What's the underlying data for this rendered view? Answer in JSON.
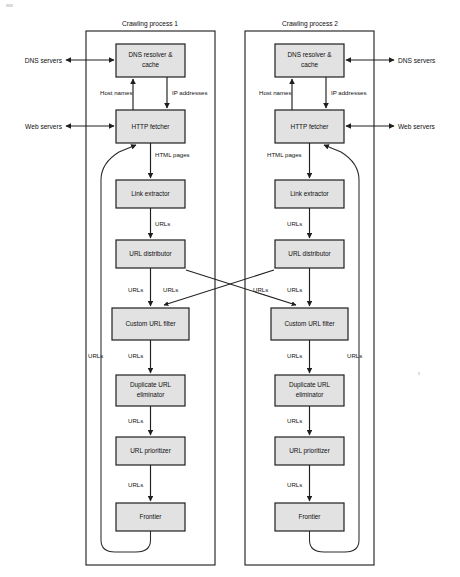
{
  "diagram": {
    "type": "flowchart",
    "canvas": {
      "width": 460,
      "height": 577
    },
    "style": {
      "box_fill": "#e2e2e2",
      "box_stroke": "#1f1f1f",
      "line_color": "#1f1f1f",
      "background": "#ffffff"
    },
    "processes": [
      {
        "id": "process-1",
        "title": "Crawling process 1",
        "mirrored": false,
        "nodes": [
          {
            "id": "dns-resolver",
            "label": "DNS resolver & cache"
          },
          {
            "id": "http-fetcher",
            "label": "HTTP fetcher"
          },
          {
            "id": "link-extractor",
            "label": "Link extractor"
          },
          {
            "id": "url-distributor",
            "label": "URL distributor"
          },
          {
            "id": "custom-url-filter",
            "label": "Custom URL filter"
          },
          {
            "id": "duplicate-url-eliminator",
            "label": "Duplicate URL eliminator"
          },
          {
            "id": "url-prioritizer",
            "label": "URL prioritizer"
          },
          {
            "id": "frontier",
            "label": "Frontier"
          }
        ],
        "edge_labels": {
          "host_names": "Host names",
          "ip_addresses": "IP addresses",
          "html_pages": "HTML pages",
          "urls_extractor_to_distributor": "URLs",
          "urls_distributor_to_filter": "URLs",
          "urls_cross_out": "URLs",
          "urls_filter_to_eliminator": "URLs",
          "urls_eliminator_to_prioritizer": "URLs",
          "urls_prioritizer_to_frontier": "URLs",
          "urls_feedback_loop": "URLs"
        },
        "external": {
          "dns_servers": "DNS servers",
          "web_servers": "Web servers"
        }
      },
      {
        "id": "process-2",
        "title": "Crawling process 2",
        "mirrored": true,
        "nodes": [
          {
            "id": "dns-resolver",
            "label": "DNS resolver & cache"
          },
          {
            "id": "http-fetcher",
            "label": "HTTP fetcher"
          },
          {
            "id": "link-extractor",
            "label": "Link extractor"
          },
          {
            "id": "url-distributor",
            "label": "URL distributor"
          },
          {
            "id": "custom-url-filter",
            "label": "Custom URL filter"
          },
          {
            "id": "duplicate-url-eliminator",
            "label": "Duplicate URL eliminator"
          },
          {
            "id": "url-prioritizer",
            "label": "URL prioritizer"
          },
          {
            "id": "frontier",
            "label": "Frontier"
          }
        ],
        "edge_labels": {
          "host_names": "Host names",
          "ip_addresses": "IP addresses",
          "html_pages": "HTML pages",
          "urls_extractor_to_distributor": "URLs",
          "urls_distributor_to_filter": "URLs",
          "urls_cross_out": "URLs",
          "urls_filter_to_eliminator": "URLs",
          "urls_eliminator_to_prioritizer": "URLs",
          "urls_prioritizer_to_frontier": "URLs",
          "urls_feedback_loop": "URLs"
        },
        "external": {
          "dns_servers": "DNS servers",
          "web_servers": "Web servers"
        }
      }
    ],
    "node_label_lines": {
      "dns_resolver_line1": "DNS resolver &",
      "dns_resolver_line2": "cache",
      "duplicate_line1": "Duplicate URL",
      "duplicate_line2": "eliminator"
    }
  }
}
